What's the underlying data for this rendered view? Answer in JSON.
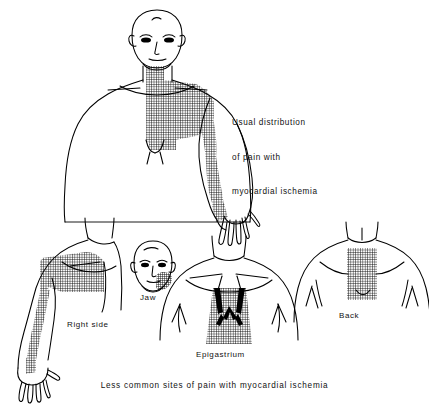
{
  "figure": {
    "type": "medical-illustration",
    "subject": "Distribution of pain with myocardial ischemia",
    "main_panel": {
      "name": "usual-distribution",
      "caption_lines": [
        "Usual distribution",
        "of pain with",
        "myocardial ischemia"
      ],
      "caption_text": "Usual distribution of pain with myocardial ischemia",
      "pain_regions": [
        "retrosternal chest",
        "left anterior chest",
        "left shoulder",
        "left medial arm",
        "left ulnar forearm",
        "left hand and fingers"
      ]
    },
    "bottom_caption": "Less common sites of pain with myocardial ischemia",
    "panels": [
      {
        "id": "right-side",
        "label": "Right side",
        "pain_regions": [
          "right anterior chest",
          "right medial arm",
          "right forearm",
          "right hand"
        ]
      },
      {
        "id": "jaw",
        "label": "Jaw",
        "pain_regions": [
          "left jaw",
          "left mandible"
        ]
      },
      {
        "id": "epigastrium",
        "label": "Epigastrium",
        "pain_regions": [
          "epigastrium",
          "subxiphoid"
        ]
      },
      {
        "id": "back",
        "label": "Back",
        "pain_regions": [
          "interscapular back"
        ]
      }
    ]
  },
  "style": {
    "background": "#ffffff",
    "ink": "#000000",
    "hatch": "#1a1a1a"
  }
}
